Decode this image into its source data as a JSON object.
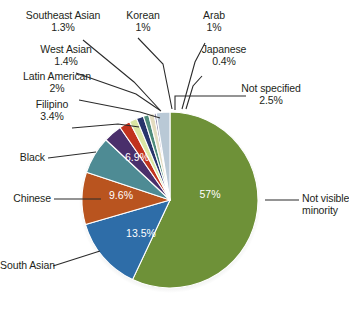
{
  "chart_data": {
    "type": "pie",
    "title": "",
    "subtitle": "",
    "xlabel": "",
    "ylabel": "",
    "legend_position": "none",
    "labels_position": "callout-leader-lines",
    "grid": false,
    "categories": [
      "Not visible minority",
      "South Asian",
      "Chinese",
      "Black",
      "Filipino",
      "Latin American",
      "West Asian",
      "Southeast Asian",
      "Korean",
      "Arab",
      "Japanese",
      "Not specified"
    ],
    "values": [
      57,
      13.5,
      9.6,
      6.9,
      3.4,
      2,
      1.4,
      1.3,
      1,
      1,
      0.4,
      2.5
    ],
    "value_labels": [
      "57%",
      "13.5%",
      "9.6%",
      "6.9%",
      "3.4%",
      "2%",
      "1.4%",
      "1.3%",
      "1%",
      "1%",
      "0.4%",
      "2.5%"
    ],
    "colors": [
      "#6E9138",
      "#2E6DA8",
      "#B9541F",
      "#4E8B94",
      "#4A2F6B",
      "#C1331E",
      "#D9E6A3",
      "#28356B",
      "#4E8B7A",
      "#E3DCC0",
      "#8C8AA8",
      "#B9C9D6"
    ],
    "value_labels_shown_on_slices": [
      "57%",
      "13.5%",
      "9.6%",
      "6.9%"
    ],
    "units": "percent"
  },
  "callouts": {
    "southeast_asian": {
      "name": "Southeast Asian",
      "value": "1.3%"
    },
    "korean": {
      "name": "Korean",
      "value": "1%"
    },
    "arab": {
      "name": "Arab",
      "value": "1%"
    },
    "west_asian": {
      "name": "West Asian",
      "value": "1.4%"
    },
    "japanese": {
      "name": "Japanese",
      "value": "0.4%"
    },
    "latin_american": {
      "name": "Latin American",
      "value": "2%"
    },
    "not_specified": {
      "name": "Not specified",
      "value": "2.5%"
    },
    "filipino": {
      "name": "Filipino",
      "value": "3.4%"
    },
    "black": {
      "name": "Black",
      "value": ""
    },
    "chinese": {
      "name": "Chinese",
      "value": ""
    },
    "south_asian": {
      "name": "South Asian",
      "value": ""
    },
    "not_visible_minority": {
      "name": "Not visible",
      "value": "minority"
    }
  },
  "slice_labels": {
    "not_visible_minority_pct": "57%",
    "south_asian_pct": "13.5%",
    "chinese_pct": "9.6%",
    "black_pct": "6.9%"
  },
  "colors": {
    "background": "#ffffff",
    "text": "#231f20",
    "leader_line": "#2b2b2b",
    "slice_outline": "#ffffff"
  }
}
